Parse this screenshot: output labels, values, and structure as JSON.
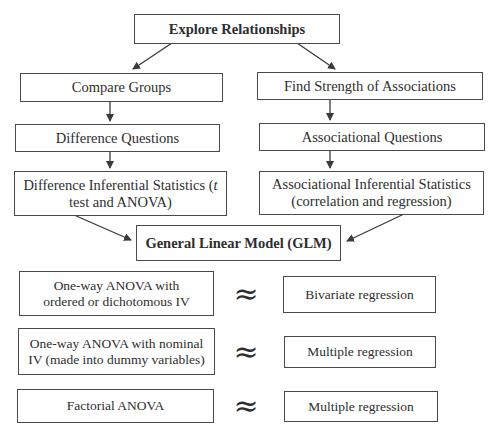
{
  "diagram": {
    "root": {
      "label": "Explore Relationships"
    },
    "left_branch": {
      "level1": "Compare Groups",
      "level2": "Difference Questions",
      "level3_line1": "Difference Inferential Statistics (t",
      "level3_line2": "test and ANOVA)",
      "level3_prefix": "Difference Inferential Statistics (",
      "level3_italic": "t",
      "level3_suffix": "test and ANOVA)"
    },
    "right_branch": {
      "level1": "Find Strength of Associations",
      "level2": "Associational Questions",
      "level3_line1": "Associational Inferential Statistics",
      "level3_line2": "(correlation and regression)"
    },
    "merge": {
      "label": "General Linear Model (GLM)"
    },
    "equivalences": [
      {
        "left_line1": "One-way ANOVA with",
        "left_line2": "ordered or dichotomous IV",
        "symbol": "≈",
        "right": "Bivariate regression"
      },
      {
        "left_line1": "One-way ANOVA with nominal",
        "left_line2": "IV  (made into dummy variables)",
        "symbol": "≈",
        "right": "Multiple regression"
      },
      {
        "left_line1": "Factorial ANOVA",
        "symbol": "≈",
        "right": "Multiple regression"
      }
    ]
  },
  "colors": {
    "text": "#2e2e2e",
    "border": "#4a4a4a",
    "background": "#ffffff"
  }
}
